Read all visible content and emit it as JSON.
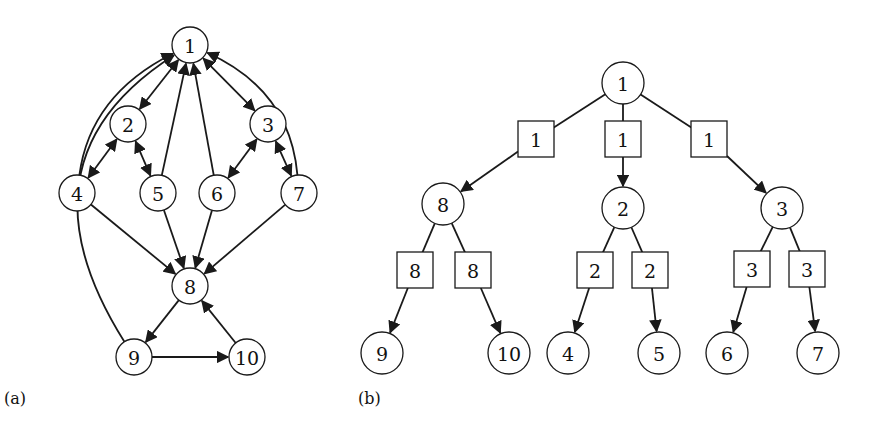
{
  "figure": {
    "panel_a": {
      "label": "(a)",
      "label_pos": [
        4,
        404
      ],
      "node_radius": 18,
      "nodes": [
        {
          "id": "1",
          "x": 190,
          "y": 45
        },
        {
          "id": "2",
          "x": 128,
          "y": 124
        },
        {
          "id": "3",
          "x": 268,
          "y": 124
        },
        {
          "id": "4",
          "x": 77,
          "y": 193
        },
        {
          "id": "5",
          "x": 158,
          "y": 193
        },
        {
          "id": "6",
          "x": 217,
          "y": 193
        },
        {
          "id": "7",
          "x": 299,
          "y": 193
        },
        {
          "id": "8",
          "x": 190,
          "y": 286
        },
        {
          "id": "9",
          "x": 134,
          "y": 357
        },
        {
          "id": "10",
          "x": 247,
          "y": 357
        }
      ],
      "edges": [
        {
          "from": "1",
          "to": "2",
          "bidirectional": true
        },
        {
          "from": "1",
          "to": "3",
          "bidirectional": true
        },
        {
          "from": "2",
          "to": "4",
          "bidirectional": true
        },
        {
          "from": "2",
          "to": "5",
          "bidirectional": true
        },
        {
          "from": "3",
          "to": "6",
          "bidirectional": true
        },
        {
          "from": "3",
          "to": "7",
          "bidirectional": true
        },
        {
          "from": "4",
          "to": "1",
          "curve": [
            90,
            95
          ]
        },
        {
          "from": "5",
          "to": "1"
        },
        {
          "from": "6",
          "to": "1"
        },
        {
          "from": "7",
          "to": "1",
          "curve": [
            290,
            90
          ]
        },
        {
          "from": "9",
          "to": "1",
          "curve": [
            10,
            160
          ]
        },
        {
          "from": "4",
          "to": "8"
        },
        {
          "from": "5",
          "to": "8"
        },
        {
          "from": "6",
          "to": "8"
        },
        {
          "from": "7",
          "to": "8"
        },
        {
          "from": "8",
          "to": "9"
        },
        {
          "from": "9",
          "to": "10"
        },
        {
          "from": "10",
          "to": "8"
        }
      ]
    },
    "panel_b": {
      "label": "(b)",
      "label_pos": [
        358,
        404
      ],
      "node_radius": 21,
      "box_size": 36,
      "nodes": [
        {
          "id": "1",
          "x": 623,
          "y": 83
        },
        {
          "id": "8",
          "x": 443,
          "y": 204
        },
        {
          "id": "2",
          "x": 623,
          "y": 208
        },
        {
          "id": "3",
          "x": 782,
          "y": 208
        },
        {
          "id": "9",
          "x": 382,
          "y": 353
        },
        {
          "id": "10",
          "x": 509,
          "y": 353
        },
        {
          "id": "4",
          "x": 568,
          "y": 353
        },
        {
          "id": "5",
          "x": 659,
          "y": 353
        },
        {
          "id": "6",
          "x": 727,
          "y": 353
        },
        {
          "id": "7",
          "x": 818,
          "y": 353
        }
      ],
      "boxes": [
        {
          "label": "1",
          "x": 536,
          "y": 139,
          "from": "1",
          "to": "8"
        },
        {
          "label": "1",
          "x": 623,
          "y": 139,
          "from": "1",
          "to": "2"
        },
        {
          "label": "1",
          "x": 709,
          "y": 139,
          "from": "1",
          "to": "3"
        },
        {
          "label": "8",
          "x": 415,
          "y": 270,
          "from": "8",
          "to": "9"
        },
        {
          "label": "8",
          "x": 473,
          "y": 270,
          "from": "8",
          "to": "10"
        },
        {
          "label": "2",
          "x": 595,
          "y": 270,
          "from": "2",
          "to": "4"
        },
        {
          "label": "2",
          "x": 650,
          "y": 270,
          "from": "2",
          "to": "5"
        },
        {
          "label": "3",
          "x": 752,
          "y": 269,
          "from": "3",
          "to": "6"
        },
        {
          "label": "3",
          "x": 807,
          "y": 269,
          "from": "3",
          "to": "7"
        }
      ]
    },
    "colors": {
      "stroke": "#1a1a1a",
      "background": "#ffffff"
    }
  }
}
